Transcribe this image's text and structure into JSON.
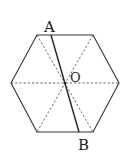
{
  "diagram": {
    "type": "geometry",
    "shape": "regular hexagon",
    "labels": {
      "A": "A",
      "B": "B",
      "O": "O"
    },
    "vertices": [
      [
        37,
        35
      ],
      [
        93,
        35
      ],
      [
        119,
        83
      ],
      [
        93,
        132
      ],
      [
        37,
        132
      ],
      [
        11,
        83
      ]
    ],
    "center": [
      65,
      83
    ],
    "segment_AB": {
      "from": [
        51,
        35
      ],
      "to": [
        79,
        132
      ]
    },
    "line_color": "#333333",
    "dash_color": "#555555"
  }
}
